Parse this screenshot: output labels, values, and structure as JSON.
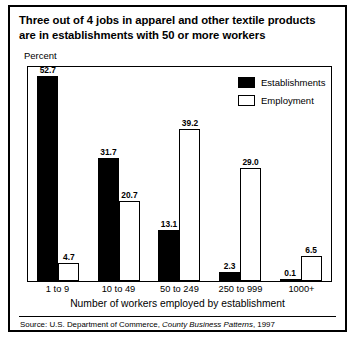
{
  "figure": {
    "title_line_1": "Three out of 4 jobs in apparel and other textile products",
    "title_line_2": "are in establishments with 50 or more workers",
    "y_axis_caption": "Percent",
    "x_axis_title": "Number of workers employed by establishment",
    "source_prefix": "Source: U.S. Department of Commerce, ",
    "source_italic": "County Business Patterns",
    "source_suffix": ", 1997"
  },
  "legend": {
    "items": [
      {
        "label": "Establishments",
        "swatch": "filled-black-square",
        "color": "#000000"
      },
      {
        "label": "Employment",
        "swatch": "hollow-white-square",
        "color": "#ffffff"
      }
    ]
  },
  "chart_data": {
    "type": "bar",
    "title": "Three out of 4 jobs in apparel and other textile products are in establishments with 50 or more workers",
    "xlabel": "Number of workers employed by establishment",
    "ylabel": "Percent",
    "ylim": [
      0,
      55
    ],
    "grid": false,
    "legend_position": "top-right",
    "categories": [
      "1 to 9",
      "10 to 49",
      "50 to 249",
      "250 to 999",
      "1000+"
    ],
    "series": [
      {
        "name": "Establishments",
        "color": "#000000",
        "values": [
          52.7,
          31.7,
          13.1,
          2.3,
          0.1
        ],
        "labels": [
          "52.7",
          "31.7",
          "13.1",
          "2.3",
          "0.1"
        ]
      },
      {
        "name": "Employment",
        "color": "#ffffff",
        "values": [
          4.7,
          20.7,
          39.2,
          29.0,
          6.5
        ],
        "labels": [
          "4.7",
          "20.7",
          "39.2",
          "29.0",
          "6.5"
        ]
      }
    ],
    "source": "Source: U.S. Department of Commerce, County Business Patterns, 1997"
  }
}
